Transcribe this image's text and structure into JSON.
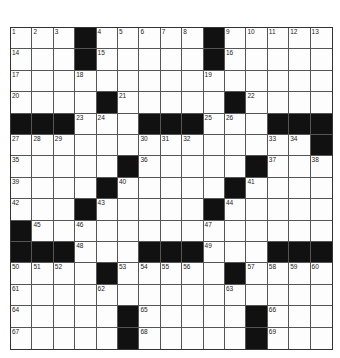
{
  "puzzle": {
    "rows": 15,
    "cols": 15,
    "grid": [
      "...#.....#.....",
      "...#.....#.....",
      "...............",
      "....#.....#....",
      "###...###...###",
      "..............#",
      ".....#.....#...",
      "....#.....#....",
      "...#.....#.....",
      "#..............",
      "###...###...###",
      "....#.....#....",
      "...............",
      ".....#.....#...",
      ".....#.....#..."
    ],
    "numbers": [
      {
        "r": 0,
        "c": 0,
        "n": 1
      },
      {
        "r": 0,
        "c": 1,
        "n": 2
      },
      {
        "r": 0,
        "c": 2,
        "n": 3
      },
      {
        "r": 0,
        "c": 4,
        "n": 4
      },
      {
        "r": 0,
        "c": 5,
        "n": 5
      },
      {
        "r": 0,
        "c": 6,
        "n": 6
      },
      {
        "r": 0,
        "c": 7,
        "n": 7
      },
      {
        "r": 0,
        "c": 8,
        "n": 8
      },
      {
        "r": 0,
        "c": 10,
        "n": 9
      },
      {
        "r": 0,
        "c": 11,
        "n": 10
      },
      {
        "r": 0,
        "c": 12,
        "n": 11
      },
      {
        "r": 0,
        "c": 13,
        "n": 12
      },
      {
        "r": 0,
        "c": 14,
        "n": 13
      },
      {
        "r": 1,
        "c": 0,
        "n": 14
      },
      {
        "r": 1,
        "c": 4,
        "n": 15
      },
      {
        "r": 1,
        "c": 10,
        "n": 16
      },
      {
        "r": 2,
        "c": 0,
        "n": 17
      },
      {
        "r": 2,
        "c": 3,
        "n": 18
      },
      {
        "r": 2,
        "c": 9,
        "n": 19
      },
      {
        "r": 3,
        "c": 0,
        "n": 20
      },
      {
        "r": 3,
        "c": 5,
        "n": 21
      },
      {
        "r": 3,
        "c": 11,
        "n": 22
      },
      {
        "r": 4,
        "c": 3,
        "n": 23
      },
      {
        "r": 4,
        "c": 4,
        "n": 24
      },
      {
        "r": 4,
        "c": 9,
        "n": 25
      },
      {
        "r": 4,
        "c": 10,
        "n": 26
      },
      {
        "r": 5,
        "c": 0,
        "n": 27
      },
      {
        "r": 5,
        "c": 1,
        "n": 28
      },
      {
        "r": 5,
        "c": 2,
        "n": 29
      },
      {
        "r": 5,
        "c": 6,
        "n": 30
      },
      {
        "r": 5,
        "c": 7,
        "n": 31
      },
      {
        "r": 5,
        "c": 8,
        "n": 32
      },
      {
        "r": 5,
        "c": 12,
        "n": 33
      },
      {
        "r": 5,
        "c": 13,
        "n": 34
      },
      {
        "r": 6,
        "c": 0,
        "n": 35
      },
      {
        "r": 6,
        "c": 6,
        "n": 36
      },
      {
        "r": 6,
        "c": 12,
        "n": 37
      },
      {
        "r": 6,
        "c": 14,
        "n": 38
      },
      {
        "r": 7,
        "c": 0,
        "n": 39
      },
      {
        "r": 7,
        "c": 5,
        "n": 40
      },
      {
        "r": 7,
        "c": 11,
        "n": 41
      },
      {
        "r": 8,
        "c": 0,
        "n": 42
      },
      {
        "r": 8,
        "c": 4,
        "n": 43
      },
      {
        "r": 8,
        "c": 10,
        "n": 44
      },
      {
        "r": 9,
        "c": 1,
        "n": 45
      },
      {
        "r": 9,
        "c": 3,
        "n": 46
      },
      {
        "r": 9,
        "c": 9,
        "n": 47
      },
      {
        "r": 10,
        "c": 3,
        "n": 48
      },
      {
        "r": 10,
        "c": 9,
        "n": 49
      },
      {
        "r": 11,
        "c": 0,
        "n": 50
      },
      {
        "r": 11,
        "c": 1,
        "n": 51
      },
      {
        "r": 11,
        "c": 2,
        "n": 52
      },
      {
        "r": 11,
        "c": 5,
        "n": 53
      },
      {
        "r": 11,
        "c": 6,
        "n": 54
      },
      {
        "r": 11,
        "c": 7,
        "n": 55
      },
      {
        "r": 11,
        "c": 8,
        "n": 56
      },
      {
        "r": 11,
        "c": 11,
        "n": 57
      },
      {
        "r": 11,
        "c": 12,
        "n": 58
      },
      {
        "r": 11,
        "c": 13,
        "n": 59
      },
      {
        "r": 11,
        "c": 14,
        "n": 60
      },
      {
        "r": 12,
        "c": 0,
        "n": 61
      },
      {
        "r": 12,
        "c": 4,
        "n": 62
      },
      {
        "r": 12,
        "c": 10,
        "n": 63
      },
      {
        "r": 13,
        "c": 0,
        "n": 64
      },
      {
        "r": 13,
        "c": 6,
        "n": 65
      },
      {
        "r": 13,
        "c": 12,
        "n": 66
      },
      {
        "r": 14,
        "c": 0,
        "n": 67
      },
      {
        "r": 14,
        "c": 6,
        "n": 68
      },
      {
        "r": 14,
        "c": 12,
        "n": 69
      }
    ]
  },
  "colors": {
    "block": "#111111",
    "line": "#555555",
    "background": "#ffffff"
  }
}
